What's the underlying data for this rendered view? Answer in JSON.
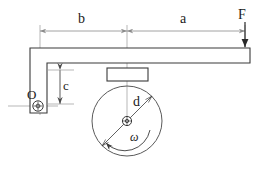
{
  "figure": {
    "background_color": "#ffffff",
    "line_color": "#3a3a3a",
    "dim_line_color": "#8a8a8a",
    "text_color": "#1a1a1a",
    "width": 259,
    "height": 173
  },
  "labels": {
    "dimension_b": "b",
    "dimension_a": "a",
    "force_F": "F",
    "dimension_c": "c",
    "pivot_O": "O",
    "diameter_d": "d",
    "angular_velocity": "ω"
  },
  "annotations": {
    "dimension_b_description": "Horizontal distance from pivot O centerline to brake shoe centerline",
    "dimension_a_description": "Horizontal distance from brake shoe centerline to applied force F",
    "dimension_c_description": "Vertical offset from lever underside to pivot O centerline",
    "force_F_description": "Downward applied force at free end of lever",
    "diameter_d_description": "Brake drum diameter",
    "omega_description": "Drum angular velocity, counter-clockwise"
  },
  "geometry": {
    "pivot_center": {
      "x": 38,
      "y": 106
    },
    "wheel_center": {
      "x": 127,
      "y": 121
    },
    "wheel_radius": 35,
    "shoe_rect": {
      "x": 107,
      "y": 68,
      "width": 41,
      "height": 13
    },
    "beam_top_y": 48,
    "beam_bottom_y": 63,
    "beam_right_x": 250,
    "lever_left_x": 30,
    "dim_line_y": 31,
    "dim_b_from_x": 40,
    "dim_b_to_x": 127,
    "dim_a_from_x": 127,
    "dim_a_to_x": 245
  }
}
